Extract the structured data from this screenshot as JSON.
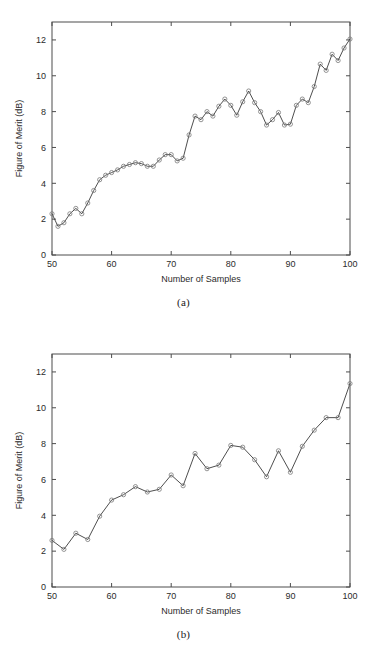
{
  "document": {
    "type": "figure-pair",
    "background_color": "#ffffff",
    "line_color": "#3a3a3a",
    "marker_color": "#7a7a7a",
    "axis_color": "#4d4d4d",
    "text_color": "#2b2b2b"
  },
  "figures": [
    {
      "caption": "(a)"
    },
    {
      "caption": "(b)"
    }
  ],
  "chart_data": [
    {
      "type": "line",
      "title": "",
      "subtitle": "",
      "caption": "(a)",
      "xlabel": "Number of Samples",
      "ylabel": "Figure of Merit (dB)",
      "xlim": [
        50,
        100
      ],
      "ylim": [
        0,
        13
      ],
      "xticks": [
        50,
        60,
        70,
        80,
        90,
        100
      ],
      "xtick_labels": [
        "50",
        "60",
        "70",
        "80",
        "90",
        "100"
      ],
      "yticks": [
        0,
        2,
        4,
        6,
        8,
        10,
        12
      ],
      "ytick_labels": [
        "0",
        "2",
        "4",
        "6",
        "8",
        "10",
        "12"
      ],
      "grid": false,
      "legend": null,
      "marker": "circle",
      "x": [
        50,
        51,
        52,
        53,
        54,
        55,
        56,
        57,
        58,
        59,
        60,
        61,
        62,
        63,
        64,
        65,
        66,
        67,
        68,
        69,
        70,
        71,
        72,
        73,
        74,
        75,
        76,
        77,
        78,
        79,
        80,
        81,
        82,
        83,
        84,
        85,
        86,
        87,
        88,
        89,
        90,
        91,
        92,
        93,
        94,
        95,
        96,
        97,
        98,
        99,
        100
      ],
      "values": [
        2.3,
        1.6,
        1.8,
        2.3,
        2.6,
        2.3,
        2.9,
        3.6,
        4.2,
        4.45,
        4.6,
        4.75,
        4.95,
        5.05,
        5.15,
        5.1,
        4.95,
        4.95,
        5.3,
        5.6,
        5.6,
        5.25,
        5.4,
        6.7,
        7.75,
        7.55,
        8.0,
        7.75,
        8.3,
        8.7,
        8.35,
        7.8,
        8.55,
        9.15,
        8.5,
        8.0,
        7.25,
        7.55,
        7.95,
        7.25,
        7.3,
        8.35,
        8.7,
        8.5,
        9.4,
        10.65,
        10.3,
        11.2,
        10.85,
        11.55,
        12.05
      ]
    },
    {
      "type": "line",
      "title": "",
      "subtitle": "",
      "caption": "(b)",
      "xlabel": "Number of Samples",
      "ylabel": "Figure of Merit (dB)",
      "xlim": [
        50,
        100
      ],
      "ylim": [
        0,
        13
      ],
      "xticks": [
        50,
        60,
        70,
        80,
        90,
        100
      ],
      "xtick_labels": [
        "50",
        "60",
        "70",
        "80",
        "90",
        "100"
      ],
      "yticks": [
        0,
        2,
        4,
        6,
        8,
        10,
        12
      ],
      "ytick_labels": [
        "0",
        "2",
        "4",
        "6",
        "8",
        "10",
        "12"
      ],
      "grid": false,
      "legend": null,
      "marker": "circle",
      "x": [
        50,
        52,
        54,
        56,
        58,
        60,
        62,
        64,
        66,
        68,
        70,
        72,
        74,
        76,
        78,
        80,
        82,
        84,
        86,
        88,
        90,
        92,
        94,
        96,
        98,
        100
      ],
      "values": [
        2.6,
        2.1,
        3.0,
        2.65,
        3.95,
        4.85,
        5.15,
        5.6,
        5.3,
        5.45,
        6.25,
        5.65,
        7.45,
        6.6,
        6.8,
        7.9,
        7.8,
        7.1,
        6.15,
        7.6,
        6.4,
        7.85,
        8.75,
        9.45,
        9.45,
        11.35
      ]
    }
  ]
}
